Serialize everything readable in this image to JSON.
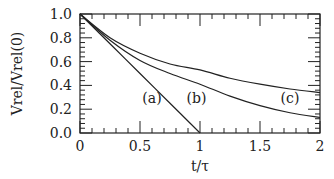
{
  "chart_data": {
    "type": "line",
    "title": "",
    "xlabel": "t/τ",
    "ylabel": "Vrel/Vrel(0)",
    "xlim": [
      0,
      2
    ],
    "ylim": [
      0,
      1
    ],
    "x_ticks": [
      "0",
      "0.5",
      "1",
      "1.5",
      "2"
    ],
    "y_ticks": [
      "0.0",
      "0.2",
      "0.4",
      "0.6",
      "0.8",
      "1.0"
    ],
    "grid": false,
    "legend": "none (inline curve labels)",
    "x": [
      0,
      0.25,
      0.5,
      0.75,
      1.0,
      1.25,
      1.5,
      1.75,
      2.0
    ],
    "series": [
      {
        "name": "(a)",
        "values": [
          1.0,
          0.75,
          0.5,
          0.25,
          0.0,
          null,
          null,
          null,
          null
        ]
      },
      {
        "name": "(b)",
        "values": [
          1.0,
          0.78,
          0.61,
          0.5,
          0.41,
          0.31,
          0.23,
          0.17,
          0.13
        ]
      },
      {
        "name": "(c)",
        "values": [
          1.0,
          0.8,
          0.67,
          0.58,
          0.53,
          0.46,
          0.41,
          0.37,
          0.34
        ]
      }
    ],
    "annotations": [
      {
        "text": "(a)",
        "x": 0.6,
        "y": 0.29
      },
      {
        "text": "(b)",
        "x": 0.97,
        "y": 0.29
      },
      {
        "text": "(c)",
        "x": 1.75,
        "y": 0.29
      }
    ]
  }
}
